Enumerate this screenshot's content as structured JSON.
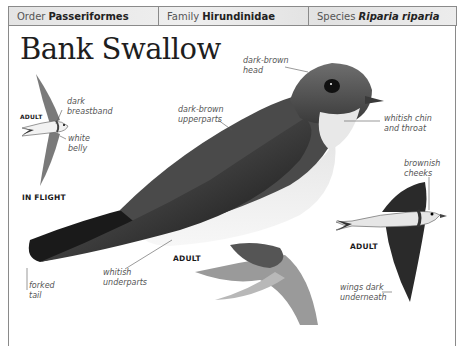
{
  "header": {
    "order_label": "Order",
    "order_value": "Passeriformes",
    "family_label": "Family",
    "family_value": "Hirundinidae",
    "species_label": "Species",
    "species_value": "Riparia riparia"
  },
  "title": "Bank Swallow",
  "in_flight_figure": {
    "caption": "IN FLIGHT",
    "sub_caption": "ADULT",
    "labels": {
      "breastband_1": "dark",
      "breastband_2": "breastband",
      "belly_1": "white",
      "belly_2": "belly"
    }
  },
  "perched_figure": {
    "caption": "ADULT",
    "labels": {
      "head_1": "dark-brown",
      "head_2": "head",
      "upperparts_1": "dark-brown",
      "upperparts_2": "upperparts",
      "chin_1": "whitish chin",
      "chin_2": "and throat",
      "underparts_1": "whitish",
      "underparts_2": "underparts",
      "tail_1": "forked",
      "tail_2": "tail"
    }
  },
  "flying_figure": {
    "caption": "ADULT",
    "labels": {
      "cheeks_1": "brownish",
      "cheeks_2": "cheeks",
      "wings_1": "wings dark",
      "wings_2": "underneath"
    }
  },
  "colors": {
    "header_bg": "#e8e8e8",
    "border": "#8a8a8a",
    "label_text": "#555555",
    "bird_dark": "#1a1a1a",
    "bird_mid": "#555555"
  }
}
